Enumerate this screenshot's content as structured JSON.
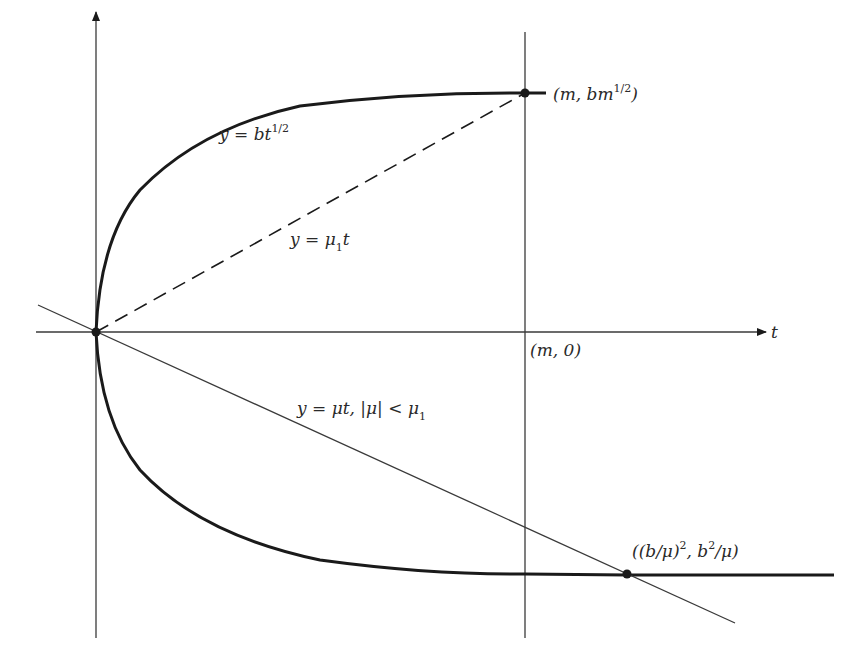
{
  "diagram": {
    "axes": {
      "horizontal_label": "t",
      "vertical_label": ""
    },
    "curves": {
      "upper": {
        "label_lhs": "y = bt",
        "label_exp": "1/2"
      },
      "lower": {
        "label": ""
      }
    },
    "lines": {
      "dashed": {
        "label_lhs": "y = μ",
        "label_sub": "1",
        "label_rhs": "t"
      },
      "solid": {
        "label_main": "y = μt, |μ| < μ",
        "label_sub": "1"
      }
    },
    "points": {
      "top": {
        "label_pre": "(m, bm",
        "label_exp": "1/2",
        "label_post": ")"
      },
      "axis": {
        "label": "(m, 0)"
      },
      "intersection": {
        "label_a": "((b/μ)",
        "label_a_exp": "2",
        "label_b": ", b",
        "label_b_exp": "2",
        "label_c": "/μ)"
      }
    },
    "colors": {
      "ink": "#1a1a1a",
      "thin_line": "#3a3a3a",
      "background": "#ffffff"
    }
  }
}
